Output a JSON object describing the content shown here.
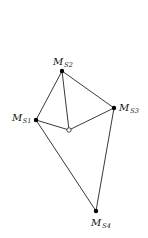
{
  "diagram": {
    "type": "graph",
    "nodes": [
      {
        "id": "S1",
        "label_main": "M",
        "label_sub": "S1",
        "x": 36,
        "y": 120,
        "style": "filled"
      },
      {
        "id": "S2",
        "label_main": "M",
        "label_sub": "S2",
        "x": 62,
        "y": 71,
        "style": "filled"
      },
      {
        "id": "S3",
        "label_main": "M",
        "label_sub": "S3",
        "x": 114,
        "y": 108,
        "style": "filled"
      },
      {
        "id": "S4",
        "label_main": "M",
        "label_sub": "S4",
        "x": 96,
        "y": 211,
        "style": "filled"
      },
      {
        "id": "C",
        "label_main": "",
        "label_sub": "",
        "x": 69,
        "y": 130,
        "style": "hollow"
      }
    ],
    "edges": [
      [
        "S1",
        "S2"
      ],
      [
        "S2",
        "S3"
      ],
      [
        "S2",
        "C"
      ],
      [
        "S1",
        "C"
      ],
      [
        "C",
        "S3"
      ],
      [
        "S1",
        "S4"
      ],
      [
        "S3",
        "S4"
      ]
    ],
    "colors": {
      "line": "#222222",
      "node_fill": "#000000",
      "hollow_fill": "#ffffff",
      "background": "#ffffff"
    }
  }
}
